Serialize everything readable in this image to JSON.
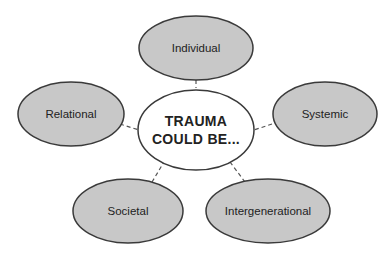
{
  "diagram": {
    "center": {
      "line1": "TRAUMA",
      "line2": "COULD BE..."
    },
    "nodes": [
      {
        "label": "Individual"
      },
      {
        "label": "Relational"
      },
      {
        "label": "Systemic"
      },
      {
        "label": "Societal"
      },
      {
        "label": "Intergenerational"
      }
    ],
    "colors": {
      "node_fill": "#c8c8c8",
      "center_fill": "#ffffff",
      "stroke": "#3a3a3a"
    }
  }
}
